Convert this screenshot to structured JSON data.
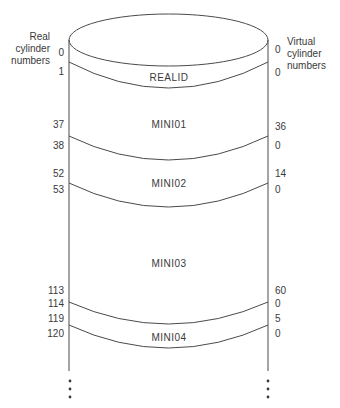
{
  "diagram": {
    "left_axis_title": [
      "Real",
      "cylinder",
      "numbers"
    ],
    "right_axis_title": [
      "Virtual",
      "cylinder",
      "numbers"
    ],
    "real_cylinder_numbers": [
      {
        "value": "0",
        "y": 38
      },
      {
        "value": "1",
        "y": 70
      },
      {
        "value": "37",
        "y": 120
      },
      {
        "value": "38",
        "y": 140
      },
      {
        "value": "52",
        "y": 168
      },
      {
        "value": "53",
        "y": 183
      },
      {
        "value": "113",
        "y": 285
      },
      {
        "value": "114",
        "y": 298
      },
      {
        "value": "119",
        "y": 313
      },
      {
        "value": "120",
        "y": 328
      }
    ],
    "virtual_cylinder_numbers": [
      {
        "value": "0",
        "y": 45
      },
      {
        "value": "0",
        "y": 70
      },
      {
        "value": "36",
        "y": 121
      },
      {
        "value": "0",
        "y": 140
      },
      {
        "value": "14",
        "y": 168
      },
      {
        "value": "0",
        "y": 183
      },
      {
        "value": "60",
        "y": 285
      },
      {
        "value": "0",
        "y": 298
      },
      {
        "value": "5",
        "y": 313
      },
      {
        "value": "0",
        "y": 328
      }
    ],
    "minidisks": [
      {
        "name": "REALID",
        "y": 72
      },
      {
        "name": "MINI01",
        "y": 120
      },
      {
        "name": "MINI02",
        "y": 177
      },
      {
        "name": "MINI03",
        "y": 257
      },
      {
        "name": "MINI04",
        "y": 331
      }
    ],
    "continuation": "⋮"
  }
}
